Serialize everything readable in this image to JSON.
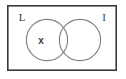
{
  "figure": {
    "background_color": "#ffffff"
  },
  "universe": {
    "name": "universal-set-rectangle",
    "label": "",
    "stroke_color": "#3a3a3a",
    "stroke_width": 1.6,
    "x": 7,
    "y": 5,
    "width": 110,
    "height": 66
  },
  "sets": [
    {
      "id": "left",
      "label": "L",
      "label_x": 22,
      "label_y": 21,
      "cx": 47,
      "cy": 40,
      "r": 21,
      "stroke_color": "#7d7d7d",
      "stroke_width": 1.1
    },
    {
      "id": "right",
      "label": "I",
      "label_x": 104,
      "label_y": 21,
      "cx": 80,
      "cy": 40,
      "r": 21,
      "stroke_color": "#7d7d7d",
      "stroke_width": 1.1
    }
  ],
  "elements": [
    {
      "name": "element-x",
      "label": "x",
      "region": "left-only",
      "x": 41,
      "y": 44,
      "color": "#3b3b3b"
    }
  ]
}
